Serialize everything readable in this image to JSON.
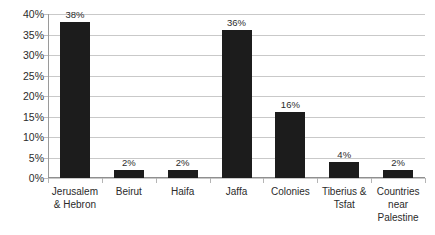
{
  "chart_data": {
    "type": "bar",
    "title": "",
    "subtitle": "",
    "xlabel": "",
    "ylabel": "",
    "categories": [
      "Jerusalem & Hebron",
      "Beirut",
      "Haifa",
      "Jaffa",
      "Colonies",
      "Tiberius & Tsfat",
      "Countries near Palestine"
    ],
    "values": [
      38,
      2,
      2,
      36,
      16,
      4,
      2
    ],
    "data_labels": [
      "38%",
      "2%",
      "2%",
      "36%",
      "16%",
      "4%",
      "2%"
    ],
    "ylim": [
      0,
      40
    ],
    "y_tick_values": [
      0,
      5,
      10,
      15,
      20,
      25,
      30,
      35,
      40
    ],
    "y_tick_labels": [
      "0%",
      "5%",
      "10%",
      "15%",
      "20%",
      "25%",
      "30%",
      "35%",
      "40%"
    ],
    "grid": "horizontal",
    "legend": "none",
    "bar_color": "#1c1c1c",
    "gridline_color": "#c9c9c9",
    "axis_color": "#8f8f8f",
    "background_color": "#ffffff"
  }
}
